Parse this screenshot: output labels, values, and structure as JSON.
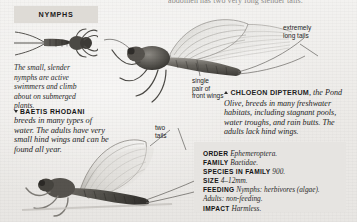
{
  "page": {
    "top_running_text": "abdomen has two very long slender tails.",
    "background_color": "#eceae7"
  },
  "nymph_panel": {
    "header": "NYMPHS",
    "image_name": "mayfly-nymph-photo",
    "caption": "The small, slender nymphs are active swimmers and climb about on submerged plants."
  },
  "baetis_caption": {
    "marker": "▼",
    "species": "BAETIS RHODANI",
    "body": "breeds in many types of water. The adults have very small hind wings and can be found all year."
  },
  "chloeon_caption": {
    "marker": "▲",
    "species": "CHLOEON DIPTERUM",
    "body": ", the Pond Olive, breeds in many freshwater habitats, including stagnant pools, water troughs, and rain butts. The adults lack hind wings."
  },
  "labels": {
    "long_tails": "extremely\nlong tails",
    "front_wings": "single\npair of\nfront wings",
    "two_tails": "two\ntails",
    "yellow_femora": "yellow\nfemora"
  },
  "fact_box": {
    "accent_color": "#e6e4e1",
    "rows": [
      {
        "key": "ORDER",
        "value": "Ephemeroptera."
      },
      {
        "key": "FAMILY",
        "value": "Baetidae."
      },
      {
        "key": "SPECIES IN FAMILY",
        "value": "900."
      },
      {
        "key": "SIZE",
        "value": "4–12mm."
      },
      {
        "key": "FEEDING",
        "value": "Nymphs: herbivores (algae)."
      }
    ],
    "feeding_sub": "Adults: non-feeding.",
    "impact_key": "IMPACT",
    "impact_value": "Harmless."
  },
  "photos": {
    "adult_mayfly": "chloeon-dipterum-adult-photo",
    "baetis_mayfly": "baetis-rhodani-adult-photo"
  }
}
